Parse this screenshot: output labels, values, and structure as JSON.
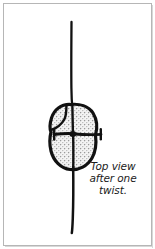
{
  "figure": {
    "name": "knot-top-view-illustration",
    "caption": "Top view\nafter one\ntwist.",
    "caption_lines": [
      "Top view",
      "after one",
      "twist."
    ],
    "alt_description": "Line drawing of an overhand knot seen from above, drawn on a single vertical rope that runs off the top and bottom of the frame.",
    "colors": {
      "ink": "#111111",
      "stipple_fill": "#d7d7d7",
      "paper": "#ffffff",
      "frame_border": "#b6b6b6",
      "frame_shadow": "#d8d8d8",
      "caption_text": "#1b1b1b"
    },
    "elements": {
      "rope_label": "rope-line",
      "knot_label": "knot-body",
      "crossing_label": "rope-crossing",
      "left_stub_label": "rope-stub-left",
      "right_stub_label": "rope-stub-right"
    }
  }
}
